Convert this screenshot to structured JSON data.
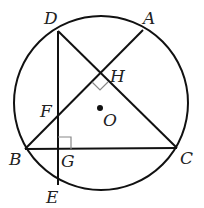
{
  "diagram": {
    "type": "geometry",
    "colors": {
      "stroke": "#111111",
      "right_angle_mark": "#888888",
      "label": "#222222"
    },
    "circle": {
      "center": "O",
      "cx": 101,
      "cy": 103,
      "r": 87
    },
    "points": {
      "A": {
        "label": "A",
        "x": 143,
        "y": 30
      },
      "B": {
        "label": "B",
        "x": 25,
        "y": 149
      },
      "C": {
        "label": "C",
        "x": 177,
        "y": 148
      },
      "D": {
        "label": "D",
        "x": 58,
        "y": 31
      },
      "E": {
        "label": "E",
        "x": 58,
        "y": 185
      },
      "F": {
        "label": "F",
        "x": 58,
        "y": 114
      },
      "G": {
        "label": "G",
        "x": 58,
        "y": 149
      },
      "H": {
        "label": "H",
        "x": 101,
        "y": 74
      },
      "O": {
        "label": "O",
        "x": 101,
        "y": 104
      }
    },
    "segments": [
      "AB",
      "BC",
      "DC",
      "DE"
    ],
    "right_angles": [
      "DHA at H (AB ⊥ DC)",
      "DGB at G (DE ⊥ BC)"
    ]
  }
}
